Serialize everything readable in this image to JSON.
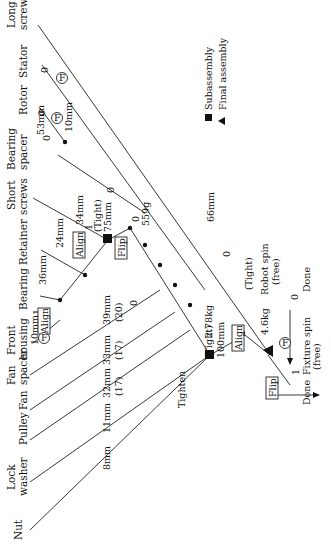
{
  "parts": [
    {
      "id": "nut",
      "label": "Nut"
    },
    {
      "id": "lock_washer",
      "label_lines": [
        "Lock",
        "washer"
      ]
    },
    {
      "id": "pulley",
      "label": "Pulley"
    },
    {
      "id": "fan",
      "label": "Fan"
    },
    {
      "id": "fan_spacer",
      "label_lines": [
        "Fan",
        "spacer"
      ]
    },
    {
      "id": "front_housing",
      "label_lines": [
        "Front",
        "housing"
      ]
    },
    {
      "id": "bearing",
      "label": "Bearing"
    },
    {
      "id": "retainer",
      "label": "Retainer"
    },
    {
      "id": "short_screws",
      "label_lines": [
        "Short",
        "screws"
      ]
    },
    {
      "id": "bearing_spacer",
      "label_lines": [
        "Bearing",
        "spacer"
      ]
    },
    {
      "id": "rotor",
      "label": "Rotor"
    },
    {
      "id": "stator",
      "label": "Stator"
    },
    {
      "id": "long_screws",
      "label_lines": [
        "Long",
        "screws"
      ]
    }
  ],
  "annotations": {
    "nut_dist": "8mm",
    "pulley_dist": "11mm",
    "fan_dist": "32mm",
    "fan_count": "(17)",
    "fan_spacer_dist": "33mm",
    "fan_spacer_count": "(17)",
    "front_housing_dist": "10mm",
    "front_housing_qty": "1",
    "bearing_dist": "36mm",
    "retainer_dist": "24mm",
    "short_screws_dist": "34mm",
    "short_screws_qty": "1",
    "tight_1": "(Tight)",
    "dist_75": "75mm",
    "weight_559": "559g",
    "zero_559": "0",
    "zero_a": "0",
    "dist_39": "39mm",
    "count_20": "(20)",
    "zero_b": "0",
    "bearing_spacer_zero": "0",
    "bearing_spacer_dist": "53mm",
    "rotor_zero": "0",
    "rotor_dist": "10mm",
    "stator_zero": "0",
    "long_screws_dist": "66mm",
    "long_screws_zero": "0",
    "tight_2": "(Tight)",
    "dist_100": "100mm",
    "weight_278": "2.78kg",
    "tight_3": "(Tight)",
    "weight_46": "4.6kg",
    "tighten": "Tighten",
    "robot_spin": "Robot spin",
    "robot_spin_free": "(free)",
    "robot_zero": "0",
    "done_1": "Done",
    "fixture_spin": "Fixture spin",
    "fixture_free": "(free)",
    "fixture_qty": "1",
    "done_2": "Done"
  },
  "operations": {
    "align_1": "Align",
    "align_2": "Align",
    "align_3": "Align",
    "flip_1": "Flip",
    "flip_2": "Flip",
    "fixture_f": "F"
  },
  "legend": {
    "subassembly": "Subassembly",
    "final_assembly": "Final assembly"
  }
}
